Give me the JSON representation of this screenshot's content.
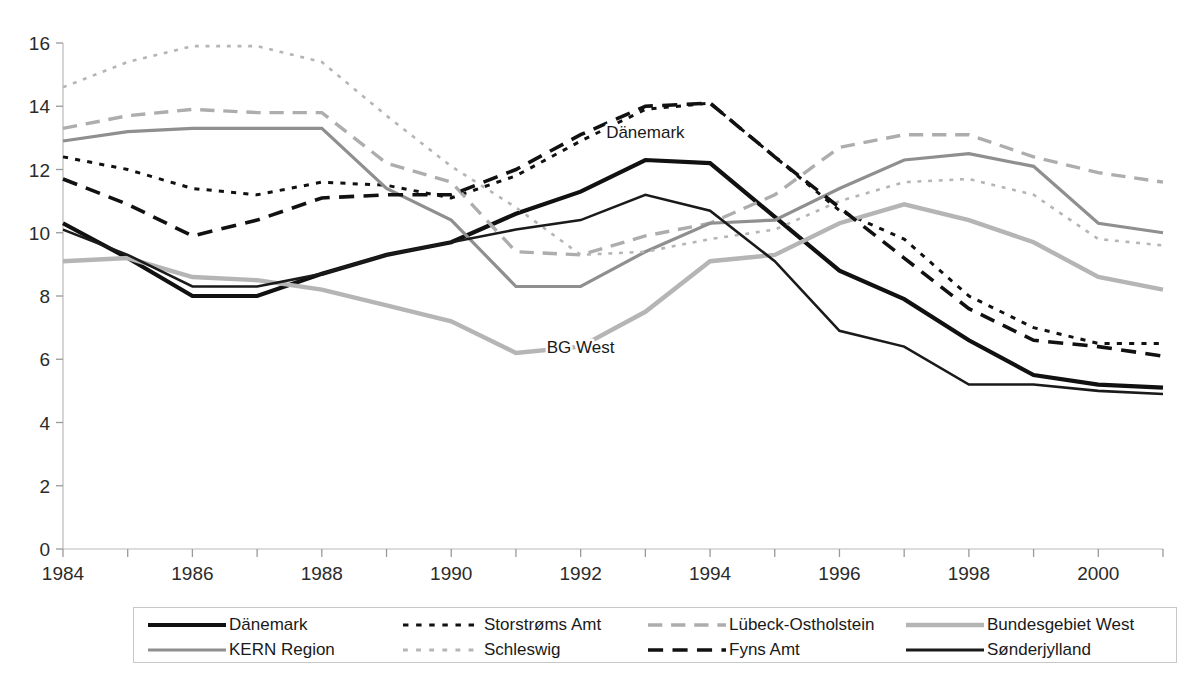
{
  "chart_data": {
    "type": "line",
    "title": "",
    "xlabel": "",
    "ylabel": "",
    "xlim": [
      1984,
      2001
    ],
    "ylim": [
      0,
      16
    ],
    "grid": false,
    "legend_position": "bottom",
    "x": [
      1984,
      1985,
      1986,
      1987,
      1988,
      1989,
      1990,
      1991,
      1992,
      1993,
      1994,
      1995,
      1996,
      1997,
      1998,
      1999,
      2000,
      2001
    ],
    "xtick_labels": [
      "1984",
      "1986",
      "1988",
      "1990",
      "1992",
      "1994",
      "1996",
      "1998",
      "2000"
    ],
    "xtick_values": [
      1984,
      1986,
      1988,
      1990,
      1992,
      1994,
      1996,
      1998,
      2000
    ],
    "ytick_labels": [
      "0",
      "2",
      "4",
      "6",
      "8",
      "10",
      "12",
      "14",
      "16"
    ],
    "ytick_values": [
      0,
      2,
      4,
      6,
      8,
      10,
      12,
      14,
      16
    ],
    "annotations": [
      {
        "text": "Dänemark",
        "x": 1993,
        "y": 13.0
      },
      {
        "text": "BG West",
        "x": 1992,
        "y": 6.2
      }
    ],
    "series": [
      {
        "name": "Dänemark",
        "style": "solid",
        "color": "#111111",
        "width": 4.2,
        "values": [
          10.3,
          9.2,
          8.0,
          8.0,
          8.7,
          9.3,
          9.7,
          10.6,
          11.3,
          12.3,
          12.2,
          10.5,
          8.8,
          7.9,
          6.6,
          5.5,
          5.2,
          5.1
        ]
      },
      {
        "name": "Storstrøms Amt",
        "style": "dashed-square",
        "color": "#111111",
        "width": 3.0,
        "values": [
          12.4,
          12.0,
          11.4,
          11.2,
          11.6,
          11.5,
          11.1,
          11.8,
          12.9,
          13.9,
          14.1,
          12.4,
          10.7,
          9.8,
          8.0,
          7.0,
          6.5,
          6.5
        ]
      },
      {
        "name": "Lübeck-Ostholstein",
        "style": "dashed-long",
        "color": "#adadad",
        "width": 3.4,
        "values": [
          13.3,
          13.7,
          13.9,
          13.8,
          13.8,
          12.2,
          11.6,
          9.4,
          9.3,
          9.9,
          10.3,
          11.2,
          12.7,
          13.1,
          13.1,
          12.4,
          11.9,
          11.6
        ]
      },
      {
        "name": "Bundesgebiet West",
        "style": "solid",
        "color": "#b5b5b5",
        "width": 4.4,
        "values": [
          9.1,
          9.2,
          8.6,
          8.5,
          8.2,
          7.7,
          7.2,
          6.2,
          6.4,
          7.5,
          9.1,
          9.3,
          10.3,
          10.9,
          10.4,
          9.7,
          8.6,
          8.2
        ]
      },
      {
        "name": "KERN Region",
        "style": "solid",
        "color": "#8f8f8f",
        "width": 3.2,
        "values": [
          12.9,
          13.2,
          13.3,
          13.3,
          13.3,
          11.4,
          10.4,
          8.3,
          8.3,
          9.4,
          10.3,
          10.4,
          11.4,
          12.3,
          12.5,
          12.1,
          10.3,
          10.0
        ]
      },
      {
        "name": "Schleswig",
        "style": "dotted-small",
        "color": "#b5b5b5",
        "width": 2.6,
        "values": [
          14.6,
          15.4,
          15.9,
          15.9,
          15.4,
          13.7,
          12.1,
          10.8,
          9.3,
          9.4,
          9.8,
          10.1,
          11.0,
          11.6,
          11.7,
          11.2,
          9.8,
          9.6
        ]
      },
      {
        "name": "Fyns Amt",
        "style": "dashed-long",
        "color": "#111111",
        "width": 3.6,
        "values": [
          11.7,
          10.9,
          9.9,
          10.4,
          11.1,
          11.2,
          11.2,
          12.0,
          13.1,
          14.0,
          14.1,
          12.4,
          10.8,
          9.2,
          7.6,
          6.6,
          6.4,
          6.1
        ]
      },
      {
        "name": "Sønderjylland",
        "style": "solid",
        "color": "#1a1a1a",
        "width": 2.6,
        "values": [
          10.1,
          9.3,
          8.3,
          8.3,
          8.7,
          9.3,
          9.7,
          10.1,
          10.4,
          11.2,
          10.7,
          9.1,
          6.9,
          6.4,
          5.2,
          5.2,
          5.0,
          4.9
        ]
      }
    ]
  },
  "legend": {
    "rows": [
      [
        {
          "label": "Dänemark",
          "series": 0
        },
        {
          "label": "Storstrøms Amt",
          "series": 1
        },
        {
          "label": "Lübeck-Ostholstein",
          "series": 2
        },
        {
          "label": "Bundesgebiet West",
          "series": 3
        }
      ],
      [
        {
          "label": "KERN Region",
          "series": 4
        },
        {
          "label": "Schleswig",
          "series": 5
        },
        {
          "label": "Fyns Amt",
          "series": 6
        },
        {
          "label": "Sønderjylland",
          "series": 7
        }
      ]
    ]
  }
}
